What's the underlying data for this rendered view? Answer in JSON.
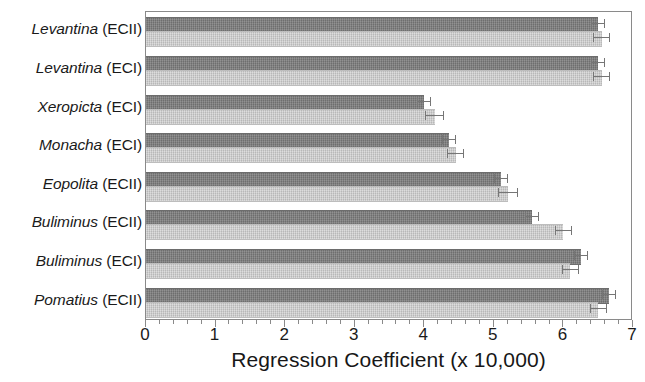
{
  "chart_data": {
    "type": "bar",
    "orientation": "horizontal",
    "title": "",
    "xlabel": "Regression Coefficient (x 10,000)",
    "ylabel": "",
    "xlim": [
      0,
      7
    ],
    "xticks": [
      "0",
      "1",
      "2",
      "3",
      "4",
      "5",
      "6",
      "7"
    ],
    "xtick_values": [
      0,
      1,
      2,
      3,
      4,
      5,
      6,
      7
    ],
    "minor_ticks_per_interval": 5,
    "grid": false,
    "legend": null,
    "categories": [
      "Levantina (ECII)",
      "Levantina (ECI)",
      "Xeropicta (ECI)",
      "Monacha (ECI)",
      "Eopolita (ECII)",
      "Buliminus (ECII)",
      "Buliminus (ECI)",
      "Pomatius (ECII)"
    ],
    "category_parts": [
      {
        "genus": "Levantina",
        "ec": " (ECII)"
      },
      {
        "genus": "Levantina",
        "ec": " (ECI)"
      },
      {
        "genus": "Xeropicta",
        "ec": " (ECI)"
      },
      {
        "genus": "Monacha",
        "ec": " (ECI)"
      },
      {
        "genus": "Eopolita",
        "ec": " (ECII)"
      },
      {
        "genus": "Buliminus",
        "ec": " (ECII)"
      },
      {
        "genus": "Buliminus",
        "ec": " (ECI)"
      },
      {
        "genus": "Pomatius",
        "ec": " (ECII)"
      }
    ],
    "series": [
      {
        "name": "series-dark",
        "color": "#7b7b7b",
        "values": [
          6.5,
          6.5,
          4.0,
          4.35,
          5.1,
          5.55,
          6.25,
          6.65
        ],
        "errors": [
          0.1,
          0.1,
          0.1,
          0.1,
          0.1,
          0.1,
          0.1,
          0.1
        ]
      },
      {
        "name": "series-light",
        "color": "#cacaca",
        "values": [
          6.55,
          6.55,
          4.15,
          4.45,
          5.2,
          6.0,
          6.1,
          6.5
        ],
        "errors": [
          0.12,
          0.12,
          0.14,
          0.12,
          0.14,
          0.12,
          0.12,
          0.12
        ]
      }
    ],
    "colors": {
      "dark_bar": "#7b7b7b",
      "light_bar": "#cacaca",
      "axis": "#8a8a8a",
      "text": "#1a1a1a",
      "error_bar": "#767676",
      "background": "#ffffff"
    }
  }
}
